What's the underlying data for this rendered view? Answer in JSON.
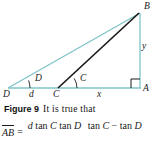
{
  "figure": {
    "label": "Figure 9",
    "caption_text": "It is true that",
    "background_color": "#ffffff"
  },
  "diagram": {
    "type": "geometry-triangle",
    "colors": {
      "teal_line": "#7fc4c8",
      "black_line": "#1a1a1a",
      "baseline": "#7fc4c8"
    },
    "vertices": [
      {
        "name": "B",
        "label": "B",
        "x": 140,
        "y": 12
      },
      {
        "name": "A",
        "label": "A",
        "x": 140,
        "y": 88
      },
      {
        "name": "D",
        "label": "D",
        "x": 8,
        "y": 88
      },
      {
        "name": "C",
        "label": "C",
        "x": 58,
        "y": 88
      }
    ],
    "side_labels": [
      {
        "name": "d",
        "label": "d",
        "between": "D to C"
      },
      {
        "name": "x",
        "label": "x",
        "between": "C to A"
      },
      {
        "name": "y",
        "label": "y",
        "between": "A to B"
      }
    ],
    "angle_labels": [
      {
        "name": "angle-D",
        "label": "D",
        "at_vertex": "D"
      },
      {
        "name": "angle-C",
        "label": "C",
        "at_vertex": "C"
      }
    ],
    "right_angle": {
      "at_vertex": "A",
      "marker": "square"
    }
  },
  "equation": {
    "lhs": "AB",
    "equals": "=",
    "numerator": "d tan C tan D",
    "denominator": "tan C − tan D",
    "numerator_parts": [
      {
        "text": "d",
        "italic": true
      },
      {
        "text": "tan",
        "italic": false
      },
      {
        "text": "C",
        "italic": true
      },
      {
        "text": "tan",
        "italic": false
      },
      {
        "text": "D",
        "italic": true
      }
    ],
    "denominator_parts": [
      {
        "text": "tan",
        "italic": false
      },
      {
        "text": "C",
        "italic": true
      },
      {
        "text": "−",
        "italic": false
      },
      {
        "text": "tan",
        "italic": false
      },
      {
        "text": "D",
        "italic": true
      }
    ]
  }
}
